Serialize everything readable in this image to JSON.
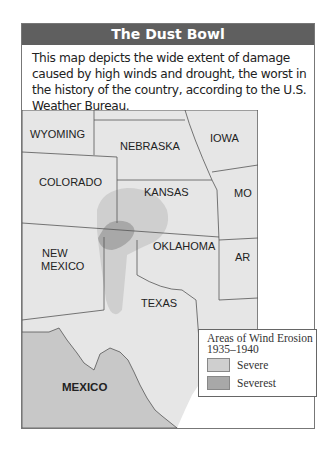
{
  "title": "The Dust Bowl",
  "caption": "This map depicts the wide extent of damage caused by high winds and drought, the worst in the history of the country, according to the U.S. Weather Bureau.",
  "map": {
    "labels": {
      "wyoming": "WYOMING",
      "nebraska": "NEBRASKA",
      "iowa": "IOWA",
      "colorado": "COLORADO",
      "kansas": "KANSAS",
      "mo": "MO",
      "new_mexico_1": "NEW",
      "new_mexico_2": "MEXICO",
      "oklahoma": "OKLAHOMA",
      "ar": "AR",
      "texas": "TEXAS",
      "mexico": "MEXICO"
    },
    "colors": {
      "land": "#e6e6e6",
      "mexico": "#c8c8c8",
      "severe": "#cfcfcf",
      "severest": "#a8a8a8",
      "border": "#555555",
      "title_bar": "#5f5f5f"
    }
  },
  "legend": {
    "title_line1": "Areas of Wind Erosion",
    "title_line2": "1935–1940",
    "items": [
      {
        "label": "Severe",
        "color": "#cfcfcf"
      },
      {
        "label": "Severest",
        "color": "#a8a8a8"
      }
    ]
  }
}
